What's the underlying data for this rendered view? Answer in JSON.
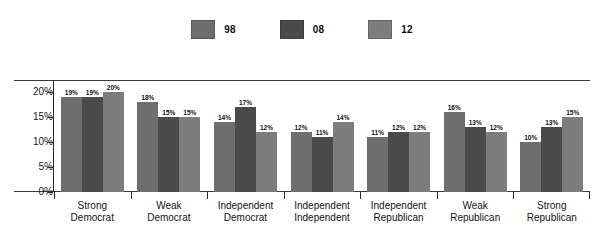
{
  "chart_data": {
    "type": "bar",
    "title": "",
    "subtitle": "",
    "xlabel": "",
    "ylabel": "",
    "ylim": [
      0,
      22.5
    ],
    "grid": false,
    "legend_position": "top-center",
    "y_ticks": [
      "0%",
      "5%",
      "10%",
      "15%",
      "20%"
    ],
    "y_tick_values": [
      0,
      5,
      10,
      15,
      20
    ],
    "categories": [
      "Strong Democrat",
      "Weak Democrat",
      "Independent Democrat",
      "Independent Independent",
      "Independent Republican",
      "Weak Republican",
      "Strong Republican"
    ],
    "category_lines": [
      [
        "Strong",
        "Democrat"
      ],
      [
        "Weak",
        "Democrat"
      ],
      [
        "Independent",
        "Democrat"
      ],
      [
        "Independent",
        "Independent"
      ],
      [
        "Independent",
        "Republican"
      ],
      [
        "Weak",
        "Republican"
      ],
      [
        "Strong",
        "Republican"
      ]
    ],
    "series": [
      {
        "name": "98",
        "color": "#6e6e6e",
        "values": [
          19,
          18,
          14,
          12,
          11,
          16,
          10
        ],
        "labels": [
          "19%",
          "18%",
          "14%",
          "12%",
          "11%",
          "16%",
          "10%"
        ]
      },
      {
        "name": "08",
        "color": "#4a4a4a",
        "values": [
          19,
          15,
          17,
          11,
          12,
          13,
          13
        ],
        "labels": [
          "19%",
          "15%",
          "17%",
          "11%",
          "12%",
          "13%",
          "13%"
        ]
      },
      {
        "name": "12",
        "color": "#7d7d7d",
        "values": [
          20,
          15,
          12,
          14,
          12,
          12,
          15
        ],
        "labels": [
          "20%",
          "15%",
          "12%",
          "14%",
          "12%",
          "12%",
          "15%"
        ]
      }
    ]
  },
  "legend": {
    "entries": [
      {
        "label": "98",
        "color": "#6e6e6e"
      },
      {
        "label": "08",
        "color": "#4a4a4a"
      },
      {
        "label": "12",
        "color": "#7d7d7d"
      }
    ]
  }
}
